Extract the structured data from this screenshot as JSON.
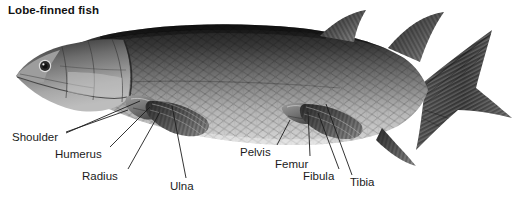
{
  "figure": {
    "title": "Lobe-finned fish",
    "width": 529,
    "height": 200,
    "background": "#ffffff",
    "text_color": "#1b1b1b",
    "leader_color": "#1d1d1d"
  },
  "labels": [
    {
      "id": "shoulder",
      "text": "Shoulder",
      "x": 12,
      "y": 131,
      "anchor": "start"
    },
    {
      "id": "humerus",
      "text": "Humerus",
      "x": 55,
      "y": 148,
      "anchor": "start"
    },
    {
      "id": "radius",
      "text": "Radius",
      "x": 82,
      "y": 170,
      "anchor": "start"
    },
    {
      "id": "ulna",
      "text": "Ulna",
      "x": 170,
      "y": 180,
      "anchor": "start"
    },
    {
      "id": "pelvis",
      "text": "Pelvis",
      "x": 240,
      "y": 146,
      "anchor": "start"
    },
    {
      "id": "femur",
      "text": "Femur",
      "x": 275,
      "y": 158,
      "anchor": "start"
    },
    {
      "id": "fibula",
      "text": "Fibula",
      "x": 303,
      "y": 170,
      "anchor": "start"
    },
    {
      "id": "tibia",
      "text": "Tibia",
      "x": 350,
      "y": 176,
      "anchor": "start"
    }
  ],
  "leaders": [
    {
      "id": "shoulder-leader-a",
      "points": "66,132 128,110"
    },
    {
      "id": "shoulder-leader-b",
      "points": "66,133 140,101"
    },
    {
      "id": "humerus-leader",
      "points": "110,147 150,107"
    },
    {
      "id": "radius-leader",
      "points": "128,169 160,112"
    },
    {
      "id": "ulna-leader",
      "points": "186,178 172,106"
    },
    {
      "id": "pelvis-leader",
      "points": "277,145 290,120"
    },
    {
      "id": "femur-leader",
      "points": "310,156 308,112"
    },
    {
      "id": "fibula-leader",
      "points": "339,169 318,113"
    },
    {
      "id": "tibia-leader",
      "points": "352,175 326,104"
    }
  ],
  "anatomy": {
    "fish_orientation": "left-facing head, right-facing forked caudal fin",
    "parts": [
      "head",
      "eye",
      "opercular-plates",
      "body-scales",
      "pectoral-lobe-fin",
      "pelvic-lobe-fin",
      "anterior-dorsal-fin",
      "posterior-dorsal-fin",
      "anal-fin",
      "caudal-fin"
    ]
  },
  "palette": {
    "ink": "#1b1b1b",
    "body_dark": "#2c2c2c",
    "body_mid": "#6f6f6f",
    "body_light": "#c8c8c8",
    "fin_dark": "#3a3a3a",
    "fin_light": "#9a9a9a",
    "paper": "#ffffff"
  }
}
